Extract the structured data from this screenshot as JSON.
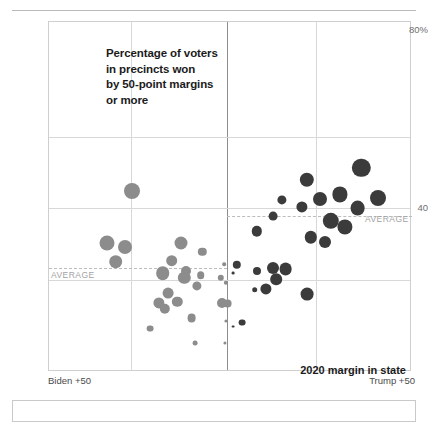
{
  "chart_data": {
    "type": "scatter",
    "title_lines": [
      "Percentage of voters",
      "in precincts won",
      "by 50-point margins",
      "or more"
    ],
    "xlabel": "2020 margin in state",
    "ylabel": "",
    "x_axis_left_label": "Biden +50",
    "x_axis_right_label": "Trump +50",
    "y_ticks": [
      "80%",
      "40"
    ],
    "ylim": [
      16,
      80
    ],
    "xlim": [
      -50,
      50
    ],
    "grid": true,
    "legend": "none",
    "annotations": [
      {
        "text": "AVERAGE",
        "series": "Biden-won states",
        "y_value": 33.0
      },
      {
        "text": "AVERAGE",
        "series": "Trump-won states",
        "y_value": 42.5
      }
    ],
    "series": [
      {
        "name": "Biden-won states",
        "color": "#8c8c8c",
        "average": 33.0,
        "points": [
          {
            "x": -27.0,
            "y": 49.0,
            "r": 8.0
          },
          {
            "x": -34.0,
            "y": 39.3,
            "r": 7.5
          },
          {
            "x": -29.0,
            "y": 38.6,
            "r": 7.0
          },
          {
            "x": -31.5,
            "y": 35.9,
            "r": 6.8
          },
          {
            "x": -13.5,
            "y": 39.3,
            "r": 6.5
          },
          {
            "x": -7.5,
            "y": 37.8,
            "r": 4.2
          },
          {
            "x": -16.0,
            "y": 36.1,
            "r": 5.8
          },
          {
            "x": -12.0,
            "y": 34.2,
            "r": 5.0
          },
          {
            "x": -18.5,
            "y": 33.8,
            "r": 6.8
          },
          {
            "x": -12.5,
            "y": 32.9,
            "r": 6.2
          },
          {
            "x": -8.0,
            "y": 33.4,
            "r": 3.8
          },
          {
            "x": -2.5,
            "y": 33.0,
            "r": 3.2
          },
          {
            "x": -9.0,
            "y": 31.5,
            "r": 4.6
          },
          {
            "x": -17.0,
            "y": 30.2,
            "r": 5.4
          },
          {
            "x": -14.5,
            "y": 28.6,
            "r": 5.2
          },
          {
            "x": -19.5,
            "y": 28.3,
            "r": 5.6
          },
          {
            "x": -18.0,
            "y": 27.3,
            "r": 5.2
          },
          {
            "x": -2.0,
            "y": 28.4,
            "r": 5.0
          },
          {
            "x": -0.5,
            "y": 28.2,
            "r": 4.4
          },
          {
            "x": -1.0,
            "y": 32.0,
            "r": 2.2
          },
          {
            "x": -1.5,
            "y": 35.5,
            "r": 1.8
          },
          {
            "x": -10.5,
            "y": 25.6,
            "r": 4.4
          },
          {
            "x": -22.0,
            "y": 23.6,
            "r": 3.4
          },
          {
            "x": -9.5,
            "y": 21.0,
            "r": 2.4
          },
          {
            "x": -1.0,
            "y": 25.0,
            "r": 1.6
          },
          {
            "x": -1.2,
            "y": 21.0,
            "r": 1.6
          }
        ]
      },
      {
        "name": "Trump-won states",
        "color": "#3b3b3b",
        "average": 42.5,
        "points": [
          {
            "x": 36.5,
            "y": 53.2,
            "r": 9.2
          },
          {
            "x": 21.5,
            "y": 51.0,
            "r": 7.2
          },
          {
            "x": 30.5,
            "y": 48.3,
            "r": 7.6
          },
          {
            "x": 41.0,
            "y": 47.7,
            "r": 8.0
          },
          {
            "x": 25.0,
            "y": 47.4,
            "r": 7.0
          },
          {
            "x": 14.5,
            "y": 47.2,
            "r": 4.6
          },
          {
            "x": 35.5,
            "y": 45.8,
            "r": 7.4
          },
          {
            "x": 20.0,
            "y": 46.0,
            "r": 5.6
          },
          {
            "x": 12.0,
            "y": 44.3,
            "r": 4.4
          },
          {
            "x": 28.0,
            "y": 43.4,
            "r": 8.2
          },
          {
            "x": 32.0,
            "y": 42.4,
            "r": 7.6
          },
          {
            "x": 7.5,
            "y": 41.5,
            "r": 5.2
          },
          {
            "x": 22.5,
            "y": 40.4,
            "r": 6.2
          },
          {
            "x": 26.5,
            "y": 39.6,
            "r": 6.0
          },
          {
            "x": 2.0,
            "y": 35.3,
            "r": 4.2
          },
          {
            "x": 7.5,
            "y": 34.3,
            "r": 4.0
          },
          {
            "x": 12.0,
            "y": 34.7,
            "r": 6.0
          },
          {
            "x": 15.5,
            "y": 34.5,
            "r": 6.4
          },
          {
            "x": 13.0,
            "y": 32.7,
            "r": 5.8
          },
          {
            "x": 10.0,
            "y": 30.9,
            "r": 5.6
          },
          {
            "x": 7.0,
            "y": 30.8,
            "r": 2.8
          },
          {
            "x": 21.5,
            "y": 29.9,
            "r": 6.4
          },
          {
            "x": 1.0,
            "y": 33.8,
            "r": 1.4
          },
          {
            "x": 3.5,
            "y": 24.7,
            "r": 3.4
          },
          {
            "x": 1.0,
            "y": 24.0,
            "r": 1.4
          }
        ]
      }
    ]
  },
  "footer": {
    "left_end": "Biden +50",
    "right_end": "Trump +50"
  }
}
